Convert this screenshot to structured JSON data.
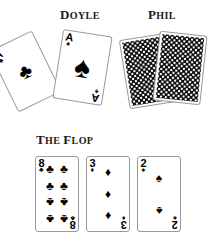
{
  "players": [
    {
      "name": "Doyle",
      "heading_first": "D",
      "heading_rest": "OYLE"
    },
    {
      "name": "Phil",
      "heading_first": "P",
      "heading_rest": "HIL"
    }
  ],
  "flop": {
    "heading_the_first": "T",
    "heading_the_rest": "HE",
    "heading_flop_first": "F",
    "heading_flop_rest": "LOP"
  },
  "doyle_hand": {
    "label": "Doyle hole cards",
    "cards": [
      {
        "rank": "A",
        "suit": "clubs",
        "suit_glyph": "♣",
        "label": "ace-of-clubs"
      },
      {
        "rank": "A",
        "suit": "spades",
        "suit_glyph": "♠",
        "label": "ace-of-spades"
      }
    ]
  },
  "phil_hand": {
    "label": "Phil hole cards",
    "cards": [
      {
        "face": "down",
        "label": "face-down-card-left"
      },
      {
        "face": "down",
        "label": "face-down-card-right"
      }
    ]
  },
  "flop_cards": [
    {
      "rank": "8",
      "suit": "clubs",
      "suit_glyph": "♣",
      "pip_count": 8,
      "label": "eight-of-clubs"
    },
    {
      "rank": "3",
      "suit": "diamonds",
      "suit_glyph": "♦",
      "pip_count": 3,
      "label": "three-of-diamonds"
    },
    {
      "rank": "2",
      "suit": "spades",
      "suit_glyph": "♠",
      "pip_count": 2,
      "label": "two-of-spades"
    }
  ],
  "colors": {
    "ink": "#000000",
    "heading": "#1a1a1a",
    "card_border": "#9a9a9a",
    "background": "#ffffff"
  }
}
